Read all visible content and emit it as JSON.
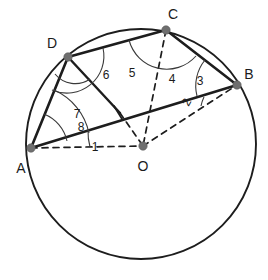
{
  "figure": {
    "background_color": "#ffffff",
    "stroke_color": "#1d1d1d",
    "vertex_dot_color": "#6f6f6f",
    "arc_color": "#3a3a3a"
  },
  "circle": {
    "center_x": 141,
    "center_y": 144,
    "radius": 115,
    "label": "circle"
  },
  "points": [
    {
      "name": "A",
      "label": "A",
      "x": 31,
      "y": 148,
      "label_x": 21,
      "label_y": 168
    },
    {
      "name": "B",
      "label": "B",
      "x": 237,
      "y": 85,
      "label_x": 246,
      "label_y": 74
    },
    {
      "name": "C",
      "label": "C",
      "x": 166,
      "y": 30,
      "label_x": 171,
      "label_y": 19
    },
    {
      "name": "D",
      "label": "D",
      "x": 68,
      "y": 57,
      "label_x": 52,
      "label_y": 45
    },
    {
      "name": "O",
      "label": "O",
      "x": 143,
      "y": 146,
      "label_x": 143,
      "label_y": 167
    }
  ],
  "chords": [
    {
      "name": "chord-DC",
      "from": "D",
      "to": "C"
    },
    {
      "name": "chord-CB",
      "from": "C",
      "to": "B"
    },
    {
      "name": "chord-AD",
      "from": "A",
      "to": "D"
    },
    {
      "name": "chord-AB",
      "from": "A",
      "to": "B"
    }
  ],
  "radii": [
    {
      "name": "segment-D-O",
      "from": "D",
      "to": "O",
      "style": "solid-then-dashed"
    },
    {
      "name": "segment-C-O",
      "from": "C",
      "to": "O",
      "style": "dashed"
    },
    {
      "name": "segment-O-B",
      "from": "O",
      "to": "B",
      "style": "dashed"
    },
    {
      "name": "segment-A-O",
      "from": "A",
      "to": "O",
      "style": "dashed"
    }
  ],
  "angle_labels": [
    {
      "name": "angle-1",
      "label": "1",
      "x": 95,
      "y": 147,
      "vertex": "A",
      "rotation": 0
    },
    {
      "name": "angle-2",
      "label": "2",
      "x": 190,
      "y": 104,
      "vertex": "B",
      "rotation": -70
    },
    {
      "name": "angle-3",
      "label": "3",
      "x": 200,
      "y": 81,
      "vertex": "B",
      "rotation": 0
    },
    {
      "name": "angle-4",
      "label": "4",
      "x": 172,
      "y": 79,
      "vertex": "C",
      "rotation": 0
    },
    {
      "name": "angle-5",
      "label": "5",
      "x": 132,
      "y": 73,
      "vertex": "C",
      "rotation": 0
    },
    {
      "name": "angle-6",
      "label": "6",
      "x": 106,
      "y": 75,
      "vertex": "D",
      "rotation": 0
    },
    {
      "name": "angle-7",
      "label": "7",
      "x": 77,
      "y": 114,
      "vertex": "D",
      "rotation": 0
    },
    {
      "name": "angle-8",
      "label": "8",
      "x": 81,
      "y": 127,
      "vertex": "A",
      "rotation": 0
    }
  ]
}
